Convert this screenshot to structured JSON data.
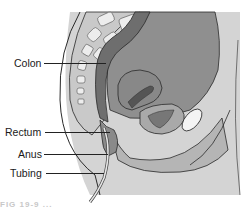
{
  "figure": {
    "labels": [
      {
        "text": "Colon",
        "x": 14,
        "y": 58,
        "line_x1": 44,
        "line_x2": 106,
        "line_y": 63
      },
      {
        "text": "Rectum",
        "x": 5,
        "y": 127,
        "line_x1": 45,
        "line_x2": 110,
        "line_y": 132
      },
      {
        "text": "Anus",
        "x": 18,
        "y": 149,
        "line_x1": 44,
        "line_x2": 108,
        "line_y": 154
      },
      {
        "text": "Tubing",
        "x": 10,
        "y": 168,
        "line_x1": 46,
        "line_x2": 104,
        "line_y": 173
      }
    ],
    "caption": "FIG 19-9 ..."
  },
  "colors": {
    "background": "#ffffff",
    "skin": "#d6d6d6",
    "outer_body": "#cfcfcf",
    "abdomen_dark": "#8e8e8e",
    "colon": "#6e6e6e",
    "vertebra": "#e8e8e8",
    "vertebra_disc": "#bdbdbd",
    "uterus": "#8a8a8a",
    "bladder": "#a8a8a8",
    "pubic_bone": "#f4f4f4",
    "outline": "#2a2a2a",
    "tubing": "#e0e0e0"
  }
}
